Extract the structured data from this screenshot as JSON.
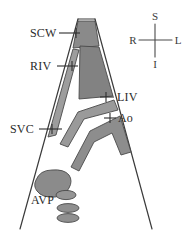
{
  "figure": {
    "background_color": "#ffffff",
    "outline_color": "#3b3b3b",
    "vessel_fill_dark": "#7e7e7e",
    "vessel_fill_mid": "#9a9a9a",
    "vessel_fill_light": "#b4b4b4",
    "label_color": "#2b2b2b"
  },
  "labels": [
    {
      "id": "scw",
      "text": "SCW",
      "meaning": "subclavian-wall-structure",
      "x": 30,
      "y": 37
    },
    {
      "id": "riv",
      "text": "RIV",
      "meaning": "right-innominate-vein",
      "x": 30,
      "y": 70
    },
    {
      "id": "svc",
      "text": "SVC",
      "meaning": "superior-vena-cava",
      "x": 12,
      "y": 133
    },
    {
      "id": "liv",
      "text": "LIV",
      "meaning": "left-innominate-vein",
      "x": 116,
      "y": 101
    },
    {
      "id": "ao",
      "text": "Ao",
      "meaning": "aorta",
      "x": 117,
      "y": 122
    },
    {
      "id": "avp",
      "text": "AVP",
      "meaning": "azygos-vein-pleura",
      "x": 33,
      "y": 203
    }
  ],
  "compass": {
    "name": "orientation-compass",
    "superior": "S",
    "right": "R",
    "left": "L",
    "inferior": "I",
    "center_x": 155,
    "center_y": 40
  }
}
